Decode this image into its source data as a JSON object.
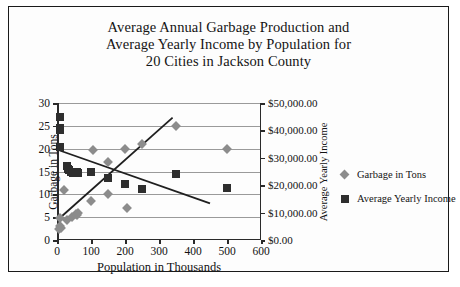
{
  "figure": {
    "title_lines": [
      "Average Annual Garbage Production and",
      "Average Yearly Income by Population for",
      "20 Cities in Jackson County"
    ]
  },
  "legend": {
    "items": [
      {
        "label": "Garbage in Tons",
        "marker": "diamond-marker",
        "color": "#8c8c8c"
      },
      {
        "label": "Average Yearly Income",
        "marker": "square-marker",
        "color": "#2e2e2e"
      }
    ]
  },
  "chart_data": {
    "type": "scatter",
    "title": "Average Annual Garbage Production and Average Yearly Income by Population for 20 Cities in Jackson County",
    "xlabel": "Population in Thousands",
    "ylabel": "Garbage in Tons",
    "y2label": "Average Yearly Income",
    "xlim": [
      0,
      600
    ],
    "ylim": [
      0,
      30
    ],
    "y2lim": [
      0,
      50000
    ],
    "xticks": [
      0,
      100,
      200,
      300,
      400,
      500,
      600
    ],
    "xticklabels": [
      "0",
      "100",
      "200",
      "300",
      "400",
      "500",
      "600"
    ],
    "yticks": [
      0,
      5,
      10,
      15,
      20,
      25,
      30
    ],
    "yticklabels": [
      "0",
      "5",
      "10",
      "15",
      "20",
      "25",
      "30"
    ],
    "y2ticks": [
      0,
      10000,
      20000,
      30000,
      40000,
      50000
    ],
    "y2ticklabels": [
      "$0.00",
      "$10,000.00",
      "$20,000.00",
      "$30,000.00",
      "$40,000.00",
      "$50,000.00"
    ],
    "grid": true,
    "grid_axis": "y",
    "legend_position": "right",
    "series": [
      {
        "name": "Garbage in Tons",
        "axis": "left",
        "marker": "diamond",
        "color": "#8c8c8c",
        "points": [
          [
            5,
            2.3
          ],
          [
            8,
            3.0
          ],
          [
            10,
            4.8
          ],
          [
            12,
            2.6
          ],
          [
            20,
            11.0
          ],
          [
            30,
            4.4
          ],
          [
            45,
            5.0
          ],
          [
            55,
            5.6
          ],
          [
            60,
            5.4
          ],
          [
            62,
            6.0
          ],
          [
            100,
            8.5
          ],
          [
            105,
            19.7
          ],
          [
            150,
            10.0
          ],
          [
            150,
            17.0
          ],
          [
            200,
            20.0
          ],
          [
            205,
            7.0
          ],
          [
            250,
            21.0
          ],
          [
            350,
            25.0
          ],
          [
            500,
            20.0
          ]
        ]
      },
      {
        "name": "Average Yearly Income",
        "axis": "right",
        "marker": "square",
        "color": "#2e2e2e",
        "points": [
          [
            8,
            45000
          ],
          [
            8,
            40000
          ],
          [
            9,
            41000
          ],
          [
            10,
            34000
          ],
          [
            30,
            27000
          ],
          [
            32,
            26000
          ],
          [
            35,
            25500
          ],
          [
            42,
            25000
          ],
          [
            48,
            24500
          ],
          [
            55,
            24800
          ],
          [
            60,
            25000
          ],
          [
            62,
            24500
          ],
          [
            100,
            25000
          ],
          [
            150,
            22500
          ],
          [
            200,
            20500
          ],
          [
            250,
            18500
          ],
          [
            350,
            24000
          ],
          [
            500,
            19000
          ]
        ]
      }
    ],
    "trendlines": [
      {
        "name": "garbage-trendline",
        "x": [
          5,
          340
        ],
        "y": [
          4.6,
          26.8
        ],
        "axis": "left",
        "color": "#1f1f1f"
      },
      {
        "name": "income-trendline",
        "x": [
          8,
          450
        ],
        "y": [
          19.6,
          8.0
        ],
        "axis": "left",
        "color": "#1f1f1f"
      }
    ]
  }
}
